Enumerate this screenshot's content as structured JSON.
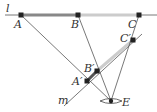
{
  "diagram": {
    "type": "perspective projection construction",
    "colors": {
      "line": "#555555",
      "thick_segment": "#888888",
      "light_segment": "#cccccc",
      "point": "#222222"
    },
    "lines": {
      "l": "l",
      "m": "m"
    },
    "points": {
      "A": "A",
      "B": "B",
      "C": "C",
      "A_prime": "A′",
      "B_prime": "B′",
      "C_prime": "C′",
      "E": "E"
    }
  }
}
